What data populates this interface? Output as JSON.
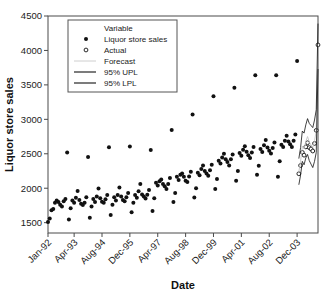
{
  "chart_data": {
    "type": "scatter",
    "title": "",
    "xlabel": "Date",
    "ylabel": "Liquor store sales",
    "ylim": [
      1350,
      4500
    ],
    "yticks": [
      1500,
      2000,
      2500,
      3000,
      3500,
      4000,
      4500
    ],
    "ytick_labels": [
      "1500",
      "2000",
      "2500",
      "3000",
      "3500",
      "4000",
      "4500"
    ],
    "xtick_labels": [
      "Jan-92",
      "Apr-93",
      "Aug-94",
      "Dec-95",
      "Apr-97",
      "Aug-98",
      "Dec-99",
      "Apr-01",
      "Aug-02",
      "Dec-03"
    ],
    "xtick_indices": [
      0,
      15,
      31,
      47,
      63,
      79,
      95,
      111,
      127,
      143
    ],
    "grid": false,
    "legend_position": "upper-left",
    "legend": {
      "title": "Variable",
      "entries": [
        {
          "label": "Liquor store sales",
          "marker": "filled-circle",
          "color": "#111111"
        },
        {
          "label": "Actual",
          "marker": "open-circle",
          "color": "#111111"
        },
        {
          "label": "Forecast",
          "marker": "line",
          "color": "#c8c8c8"
        },
        {
          "label": "95% UPL",
          "marker": "line",
          "color": "#111111"
        },
        {
          "label": "95% LPL",
          "marker": "line",
          "color": "#111111"
        }
      ]
    },
    "series": [
      {
        "name": "Liquor store sales",
        "marker": "filled-circle",
        "x_start_index": 0,
        "values": [
          1509,
          1560,
          1680,
          1700,
          1790,
          1820,
          1800,
          1760,
          1735,
          1810,
          1845,
          2520,
          1545,
          1710,
          1820,
          1790,
          1860,
          1960,
          1830,
          1775,
          1755,
          1790,
          1870,
          2455,
          1570,
          1735,
          1845,
          1800,
          1880,
          1995,
          1855,
          1805,
          1790,
          1840,
          1900,
          2595,
          1610,
          1760,
          1870,
          1820,
          1900,
          2010,
          1880,
          1830,
          1810,
          1870,
          1930,
          2605,
          1650,
          1790,
          1900,
          1860,
          1955,
          2060,
          1910,
          1880,
          1850,
          1905,
          1975,
          2555,
          1670,
          1855,
          2080,
          2040,
          2100,
          2125,
          2060,
          2030,
          1990,
          2060,
          2150,
          2845,
          1800,
          1930,
          2165,
          2120,
          2195,
          2215,
          2165,
          2110,
          2090,
          2170,
          2240,
          3070,
          1865,
          2000,
          2225,
          2190,
          2280,
          2330,
          2250,
          2215,
          2180,
          2260,
          2340,
          3335,
          1990,
          2135,
          2400,
          2360,
          2445,
          2500,
          2420,
          2380,
          2330,
          2420,
          2490,
          3460,
          2110,
          2250,
          2510,
          2470,
          2560,
          2610,
          2530,
          2480,
          2440,
          2520,
          2600,
          3640,
          2195,
          2325,
          2570,
          2525,
          2625,
          2700,
          2590,
          2545,
          2505,
          2585,
          2665,
          3640,
          2165,
          2390,
          2630,
          2600,
          2690,
          2760,
          2680,
          2640,
          2600,
          2690,
          2780,
          3845
        ]
      },
      {
        "name": "Actual",
        "marker": "open-circle",
        "x_start_index": 144,
        "values": [
          2210,
          2330,
          2520,
          2480,
          2600,
          2660,
          2590,
          2570,
          2540,
          2650,
          2840,
          4080
        ]
      },
      {
        "name": "Forecast",
        "marker": "line",
        "x_start_index": 144,
        "values": [
          2240,
          2390,
          2610,
          2570,
          2680,
          2750,
          2670,
          2630,
          2590,
          2690,
          2830,
          4060
        ]
      },
      {
        "name": "95% UPL",
        "marker": "line",
        "x_start_index": 144,
        "values": [
          2430,
          2590,
          2830,
          2800,
          2920,
          3010,
          2940,
          2910,
          2880,
          2990,
          3140,
          4390
        ]
      },
      {
        "name": "95% LPL",
        "marker": "line",
        "x_start_index": 144,
        "values": [
          2050,
          2190,
          2390,
          2340,
          2440,
          2490,
          2400,
          2350,
          2300,
          2390,
          2520,
          3730
        ]
      }
    ]
  }
}
